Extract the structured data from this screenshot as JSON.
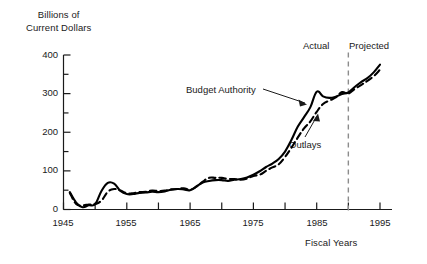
{
  "chart_data": {
    "type": "line",
    "title": "",
    "ylabel": "Billions of Current Dollars",
    "xlabel": "Fiscal Years",
    "xlim": [
      1945,
      1996
    ],
    "ylim": [
      0,
      400
    ],
    "grid": false,
    "legend_position": "inline-annotations",
    "y_ticks": [
      0,
      100,
      200,
      300,
      400
    ],
    "y_tick_labels": [
      "0",
      "100",
      "200",
      "300",
      "400"
    ],
    "y_minor_ticks": [
      50,
      150,
      250,
      350
    ],
    "x_ticks": [
      1945,
      1950,
      1955,
      1960,
      1965,
      1970,
      1975,
      1980,
      1985,
      1990,
      1995
    ],
    "x_tick_labels_shown": [
      "1945",
      "1955",
      "1965",
      "1975",
      "1985",
      "1995"
    ],
    "annotations": [
      {
        "name": "budget-authority-note",
        "text": "Budget Authority",
        "x": 1977,
        "y": 315
      },
      {
        "name": "outlays-note",
        "text": "Outlays",
        "x": 1985,
        "y": 185
      },
      {
        "name": "actual-period",
        "text": "Actual",
        "x": 1987,
        "y": 390
      },
      {
        "name": "projected-period",
        "text": "Projected",
        "x": 1993,
        "y": 390
      }
    ],
    "divider": {
      "name": "actual-projected-divider",
      "x": 1990,
      "style": "dashed"
    },
    "series": [
      {
        "name": "Budget Authority",
        "style": "solid",
        "color": "#000000",
        "x": [
          1946,
          1947,
          1948,
          1949,
          1950,
          1951,
          1952,
          1953,
          1954,
          1955,
          1956,
          1957,
          1958,
          1959,
          1960,
          1961,
          1962,
          1963,
          1964,
          1965,
          1966,
          1967,
          1968,
          1969,
          1970,
          1971,
          1972,
          1973,
          1974,
          1975,
          1976,
          1977,
          1978,
          1979,
          1980,
          1981,
          1982,
          1983,
          1984,
          1985,
          1986,
          1987,
          1988,
          1989,
          1990,
          1991,
          1992,
          1993,
          1994,
          1995
        ],
        "values": [
          45,
          18,
          6,
          11,
          14,
          48,
          69,
          67,
          48,
          40,
          40,
          43,
          44,
          46,
          45,
          47,
          51,
          53,
          52,
          50,
          60,
          70,
          74,
          76,
          76,
          74,
          77,
          79,
          83,
          90,
          99,
          110,
          119,
          131,
          150,
          180,
          214,
          239,
          265,
          305,
          293,
          289,
          292,
          299,
          303,
          317,
          330,
          340,
          355,
          375
        ]
      },
      {
        "name": "Outlays",
        "style": "dashed",
        "color": "#000000",
        "x": [
          1946,
          1947,
          1948,
          1949,
          1950,
          1951,
          1952,
          1953,
          1954,
          1955,
          1956,
          1957,
          1958,
          1959,
          1960,
          1961,
          1962,
          1963,
          1964,
          1965,
          1966,
          1967,
          1968,
          1969,
          1970,
          1971,
          1972,
          1973,
          1974,
          1975,
          1976,
          1977,
          1978,
          1979,
          1980,
          1981,
          1982,
          1983,
          1984,
          1985,
          1986,
          1987,
          1988,
          1989,
          1990,
          1991,
          1992,
          1993,
          1994,
          1995
        ],
        "values": [
          43,
          14,
          11,
          13,
          14,
          23,
          46,
          53,
          49,
          42,
          42,
          45,
          46,
          49,
          48,
          49,
          52,
          53,
          55,
          51,
          59,
          72,
          82,
          82,
          82,
          79,
          79,
          77,
          80,
          87,
          90,
          100,
          109,
          117,
          136,
          160,
          186,
          210,
          228,
          253,
          273,
          282,
          290,
          304,
          300,
          312,
          322,
          333,
          345,
          362
        ]
      }
    ]
  },
  "labels": {
    "y_axis_title_line1": "Billions of",
    "y_axis_title_line2": "Current Dollars",
    "x_axis_title": "Fiscal Years",
    "note_budget_authority": "Budget Authority",
    "note_outlays": "Outlays",
    "label_actual": "Actual",
    "label_projected": "Projected",
    "y0": "0",
    "y100": "100",
    "y200": "200",
    "y300": "300",
    "y400": "400",
    "x1945": "1945",
    "x1955": "1955",
    "x1965": "1965",
    "x1975": "1975",
    "x1985": "1985",
    "x1995": "1995"
  },
  "colors": {
    "axis": "#1a1a1a",
    "series": "#000000",
    "divider": "#8c8c8c",
    "background": "#ffffff"
  }
}
